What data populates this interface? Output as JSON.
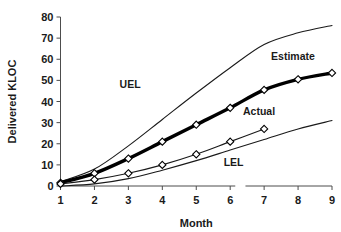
{
  "chart_data": {
    "type": "line",
    "title": "",
    "xlabel": "Month",
    "ylabel": "Delivered KLOC",
    "xlim": [
      1,
      9
    ],
    "ylim": [
      0,
      80
    ],
    "grid": false,
    "legend_position": "inline-annotations",
    "x": [
      1,
      2,
      3,
      4,
      5,
      6,
      7,
      8,
      9
    ],
    "xtick_labels": [
      "1",
      "2",
      "3",
      "4",
      "5",
      "6",
      "7",
      "8",
      "9"
    ],
    "ytick_labels": [
      "0",
      "10",
      "20",
      "30",
      "40",
      "50",
      "60",
      "70",
      "80"
    ],
    "ytick_values": [
      0,
      10,
      20,
      30,
      40,
      50,
      60,
      70,
      80
    ],
    "series": [
      {
        "name": "UEL",
        "label": "UEL",
        "style": "thin",
        "markers": false,
        "color": "#1a1a1a",
        "x": [
          1,
          2,
          3,
          4,
          5,
          6,
          7,
          8,
          9
        ],
        "values": [
          2.0,
          8.0,
          19.0,
          31.5,
          44.0,
          56.0,
          67.0,
          72.5,
          76.0
        ]
      },
      {
        "name": "Estimate",
        "label": "Estimate",
        "style": "bold",
        "markers": true,
        "color": "#000000",
        "x": [
          1,
          2,
          3,
          4,
          5,
          6,
          7,
          8,
          9
        ],
        "values": [
          1.5,
          6.0,
          13.0,
          21.0,
          29.0,
          37.0,
          45.5,
          50.5,
          53.5
        ]
      },
      {
        "name": "Actual",
        "label": "Actual",
        "style": "thin",
        "markers": true,
        "color": "#1a1a1a",
        "x": [
          1,
          2,
          3,
          4,
          5,
          6,
          7
        ],
        "values": [
          1.0,
          3.0,
          6.0,
          10.0,
          15.0,
          21.0,
          27.0
        ]
      },
      {
        "name": "LEL",
        "label": "LEL",
        "style": "thin",
        "markers": false,
        "color": "#1a1a1a",
        "x": [
          1,
          2,
          3,
          4,
          5,
          6,
          7,
          8,
          9
        ],
        "values": [
          0.0,
          1.0,
          3.5,
          7.5,
          12.0,
          17.0,
          22.0,
          27.0,
          31.0
        ]
      }
    ],
    "annotations": [
      {
        "text": "UEL",
        "x": 3.05,
        "y": 46.5
      },
      {
        "text": "Estimate",
        "x": 7.85,
        "y": 59.5
      },
      {
        "text": "Actual",
        "x": 6.85,
        "y": 33.5
      },
      {
        "text": "LEL",
        "x": 6.1,
        "y": 9.5
      }
    ]
  }
}
